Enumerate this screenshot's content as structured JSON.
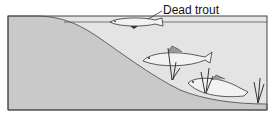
{
  "diagram": {
    "title": "",
    "labels": {
      "dead_trout": "Dead trout"
    },
    "elements": [
      {
        "name": "dead-trout",
        "description": "dead fish floating on the water surface"
      },
      {
        "name": "live-trout-upper",
        "description": "trout swimming in water near the slope"
      },
      {
        "name": "live-trout-lower",
        "description": "trout near the lake bottom"
      },
      {
        "name": "aquatic-plants",
        "description": "reeds growing on the bottom"
      }
    ],
    "colors": {
      "water": "#e4e4e4",
      "land": "#c9c9c9",
      "outline": "#333333",
      "fish": "#f2f2f2"
    }
  }
}
